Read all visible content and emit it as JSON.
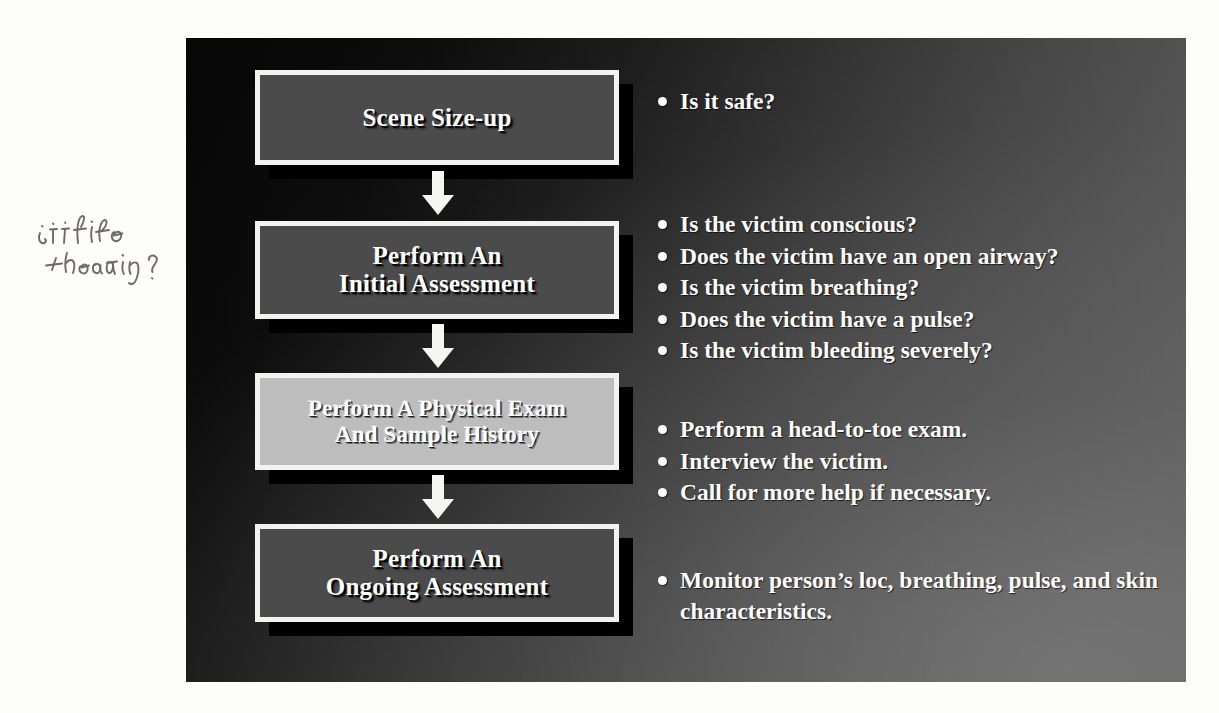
{
  "annotation": {
    "handwritten_note": "is it life threating?"
  },
  "slide": {
    "flow_boxes": [
      {
        "label": "Scene Size-up",
        "style": "dark"
      },
      {
        "label": "Perform An\nInitial Assessment",
        "style": "dark"
      },
      {
        "label": "Perform A Physical Exam\nAnd Sample History",
        "style": "light"
      },
      {
        "label": "Perform An\nOngoing Assessment",
        "style": "dark"
      }
    ],
    "arrows": [
      {
        "name": "arrow-down-1"
      },
      {
        "name": "arrow-down-2"
      },
      {
        "name": "arrow-down-3"
      }
    ],
    "bullet_groups": [
      {
        "items": [
          "Is it safe?"
        ]
      },
      {
        "items": [
          "Is the victim conscious?",
          "Does the victim have an open airway?",
          "Is the victim breathing?",
          "Does the victim have a pulse?",
          "Is the victim bleeding severely?"
        ]
      },
      {
        "items": [
          "Perform a head-to-toe exam.",
          "Interview the victim.",
          "Call for more help if necessary."
        ]
      },
      {
        "items": [
          "Monitor person’s loc, breathing, pulse, and skin characteristics."
        ]
      }
    ]
  },
  "colors": {
    "slide_dark": "#050505",
    "slide_light": "#606060",
    "box_fill_dark": "#4b4b4b",
    "box_fill_light": "#bdbdbd",
    "box_border": "#f2f2f0",
    "box_shadow": "#000000",
    "text": "#ffffff",
    "pencil": "#6e6a66"
  }
}
